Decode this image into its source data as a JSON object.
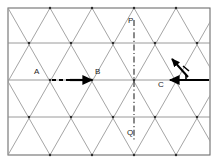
{
  "figure": {
    "kind": "triangular-lattice-diagram",
    "background_color": "#ffffff",
    "border_color": "#6e6e6e",
    "lattice_line_color": "#8c8c8c",
    "horizontal_line_color": "#8c8c8c",
    "vector_color": "#000000",
    "label_color": "#262626",
    "frame": {
      "x": 8,
      "y": 8,
      "width": 202,
      "height": 147
    },
    "rows_y": [
      8,
      43,
      80,
      117,
      155
    ],
    "column_pitch": 42,
    "half_pitch": 21
  },
  "labels": {
    "a": "A",
    "b": "B",
    "c": "C",
    "p": "P",
    "q": "Q"
  },
  "vectors": [
    {
      "name": "vector-ab",
      "label": "A",
      "from_label": "A",
      "to_label": "B",
      "x1": 44,
      "y1": 80,
      "x2": 92,
      "y2": 80,
      "direction": "right",
      "style": "dashed-then-solid"
    },
    {
      "name": "vector-c-left",
      "label": "C",
      "from_label": "right-edge",
      "to_label": "C",
      "x1": 210,
      "y1": 80,
      "x2": 169,
      "y2": 80,
      "direction": "left",
      "style": "solid"
    },
    {
      "name": "vector-diagonal-up-left",
      "x1": 191,
      "y1": 78,
      "x2": 173,
      "y2": 58,
      "direction": "up-left",
      "style": "solid-with-tick"
    }
  ],
  "axis": {
    "name": "axis-pq",
    "top_label": "P",
    "bottom_label": "Q",
    "x": 127,
    "y_top": 20,
    "y_bottom": 140,
    "style": "dash-dot",
    "color": "#3d3d3d"
  },
  "label_positions": {
    "a": {
      "x": 34,
      "y": 70
    },
    "b": {
      "x": 95,
      "y": 70
    },
    "c": {
      "x": 159,
      "y": 81
    },
    "p": {
      "x": 122,
      "y": 19
    },
    "q": {
      "x": 121,
      "y": 127
    }
  }
}
